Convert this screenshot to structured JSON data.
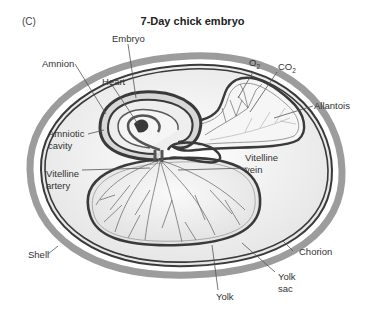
{
  "figure": {
    "panel_label": "(C)",
    "title": "7-Day chick embryo"
  },
  "labels": {
    "embryo": "Embryo",
    "amnion": "Amnion",
    "heart": "Heart",
    "amniotic_cavity_1": "Amniotic",
    "amniotic_cavity_2": "cavity",
    "vitelline_artery_1": "Vitelline",
    "vitelline_artery_2": "artery",
    "vitelline_vein_1": "Vitelline",
    "vitelline_vein_2": "vein",
    "o2": "O",
    "o2_sub": "2",
    "co2": "CO",
    "co2_sub": "2",
    "allantois": "Allantois",
    "shell": "Shell",
    "chorion": "Chorion",
    "yolk_sac_1": "Yolk",
    "yolk_sac_2": "sac",
    "yolk": "Yolk"
  },
  "colors": {
    "shell": "#9c9c9c",
    "membrane": "#3a3a3a",
    "fill": "#f2f2f2",
    "vessel": "#6a6a6a"
  }
}
